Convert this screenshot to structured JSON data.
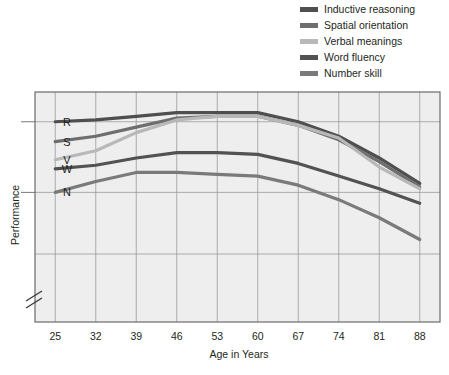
{
  "legend": {
    "items": [
      {
        "label": "Inductive reasoning",
        "color": "#4f4f4f",
        "key": "R"
      },
      {
        "label": "Spatial orientation",
        "color": "#6e6e6e",
        "key": "S"
      },
      {
        "label": "Verbal meanings",
        "color": "#b8b8b8",
        "key": "V"
      },
      {
        "label": "Word fluency",
        "color": "#525252",
        "key": "W"
      },
      {
        "label": "Number skill",
        "color": "#7a7a7a",
        "key": "N"
      }
    ]
  },
  "chart_data": {
    "type": "line",
    "title": "",
    "xlabel": "Age in Years",
    "ylabel": "Performance",
    "categories": [
      25,
      32,
      39,
      46,
      53,
      60,
      67,
      74,
      81,
      88
    ],
    "x": [
      25,
      32,
      39,
      46,
      53,
      60,
      67,
      74,
      81,
      88
    ],
    "xlim": [
      21.5,
      91.5
    ],
    "ylim": [
      0,
      100
    ],
    "grid": true,
    "legend_position": "top-right",
    "y_axis_break": true,
    "y_tick_labels": [
      "R",
      "S",
      "V",
      "W",
      "N"
    ],
    "y_tick_values": [
      78,
      67,
      57,
      52,
      39
    ],
    "gridlines_y": [
      78,
      39,
      10
    ],
    "series": [
      {
        "name": "Inductive reasoning",
        "letter": "R",
        "color": "#4f4f4f",
        "values": [
          78,
          79,
          81,
          83,
          83,
          83,
          78,
          70,
          58,
          44
        ]
      },
      {
        "name": "Spatial orientation",
        "letter": "S",
        "color": "#6e6e6e",
        "values": [
          67,
          70,
          75,
          80,
          81,
          81,
          76,
          68,
          56,
          42
        ]
      },
      {
        "name": "Verbal meanings",
        "letter": "V",
        "color": "#b8b8b8",
        "values": [
          57,
          62,
          72,
          79,
          81,
          81,
          76,
          69,
          53,
          41
        ]
      },
      {
        "name": "Word fluency",
        "letter": "W",
        "color": "#525252",
        "values": [
          52,
          54,
          58,
          61,
          61,
          60,
          55,
          48,
          41,
          33
        ]
      },
      {
        "name": "Number skill",
        "letter": "N",
        "color": "#7a7a7a",
        "values": [
          39,
          45,
          50,
          50,
          49,
          48,
          43,
          35,
          25,
          13
        ]
      }
    ]
  }
}
